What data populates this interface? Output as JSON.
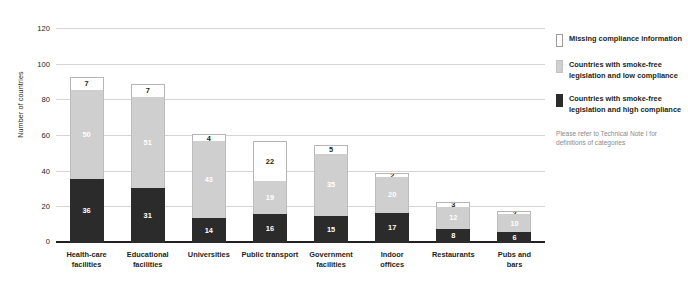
{
  "chart_data": {
    "type": "bar",
    "subtype": "stacked-vertical",
    "title": "",
    "xlabel": "",
    "ylabel": "Number of countries",
    "ylim": [
      0,
      120
    ],
    "yticks": [
      0,
      20,
      40,
      60,
      80,
      100,
      120
    ],
    "grid": true,
    "legend_position": "right",
    "categories": [
      "Health-care facilities",
      "Educational facilities",
      "Universities",
      "Public transport",
      "Government facilities",
      "Indoor offices",
      "Restaurants",
      "Pubs and bars"
    ],
    "series": [
      {
        "name": "Countries with smoke-free legislation and high compliance",
        "color": "#2b2b2b",
        "values": [
          36,
          31,
          14,
          16,
          15,
          17,
          8,
          6
        ]
      },
      {
        "name": "Countries with smoke-free legislation and low compliance",
        "color": "#cfcfcf",
        "values": [
          50,
          51,
          43,
          19,
          35,
          20,
          12,
          10
        ]
      },
      {
        "name": "Missing compliance information",
        "color": "#ffffff",
        "values": [
          7,
          7,
          4,
          22,
          5,
          2,
          3,
          2
        ]
      }
    ],
    "totals": [
      93,
      89,
      61,
      57,
      55,
      39,
      23,
      18
    ],
    "note": "Please refer to Technical Note I for definitions of categories"
  },
  "axis": {
    "y_title": "Number of countries",
    "y_tick_labels": [
      "0",
      "20",
      "40",
      "60",
      "80",
      "100",
      "120"
    ]
  },
  "x_labels": [
    {
      "line1": "Health-care",
      "line2": "facilities"
    },
    {
      "line1": "Educational",
      "line2": "facilities"
    },
    {
      "line1": "Universities",
      "line2": ""
    },
    {
      "line1": "Public transport",
      "line2": ""
    },
    {
      "line1": "Government",
      "line2": "facilities"
    },
    {
      "line1": "Indoor",
      "line2": "offices"
    },
    {
      "line1": "Restaurants",
      "line2": ""
    },
    {
      "line1": "Pubs and",
      "line2": "bars"
    }
  ],
  "legend": {
    "items": [
      {
        "label": "Missing compliance information",
        "swatch": "swatch-white"
      },
      {
        "label": "Countries with smoke-free legislation and low compliance",
        "swatch": "swatch-grey"
      },
      {
        "label": "Countries with smoke-free legislation and high compliance",
        "swatch": "swatch-black"
      }
    ],
    "note": "Please refer to Technical Note I for definitions of categories"
  }
}
